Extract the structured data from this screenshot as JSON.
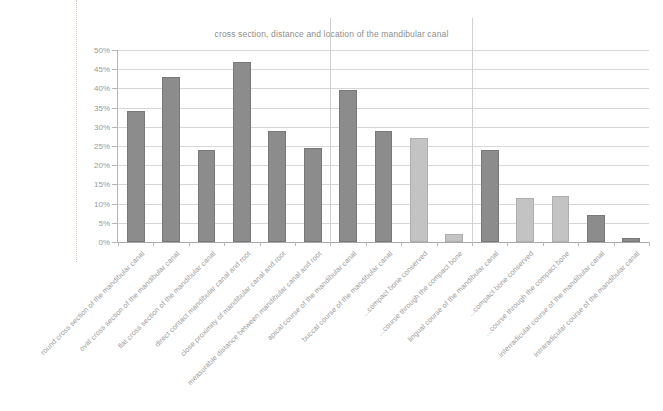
{
  "chart_data": {
    "type": "bar",
    "title": "cross section, distance and location of the mandibular canal",
    "xlabel": "",
    "ylabel": "",
    "ylim": [
      0,
      50
    ],
    "ytick_labels": [
      "0%",
      "5%",
      "10%",
      "15%",
      "20%",
      "25%",
      "30%",
      "35%",
      "40%",
      "45%",
      "50%"
    ],
    "ytick_values": [
      0,
      5,
      10,
      15,
      20,
      25,
      30,
      35,
      40,
      45,
      50
    ],
    "grid": true,
    "legend": "none",
    "value_unit": "percent",
    "categories": [
      "round cross section of the mandibular canal",
      "oval cross section of the mandibular canal",
      "flat cross section of the mandibular canal",
      "direct contact mandibular canal and root",
      "close proximity of mandibular canal and root",
      "measurable distance between mandibular canal and root",
      "apical course of the mandibular canal",
      "buccal course of the mandibular canal",
      "...compact bone conserved",
      "...course through the compact bone",
      "lingual course of the mandibular canal",
      "...compact bone conserved",
      "...course through the compact bone",
      "interradicular course of the mandibular canal",
      "intraradicular course of the mandibular canal"
    ],
    "values": [
      34,
      43,
      24,
      47,
      29,
      24.5,
      39.5,
      29,
      27,
      2,
      24,
      11.5,
      12,
      7,
      1
    ],
    "bar_shades": [
      "dark",
      "dark",
      "dark",
      "dark",
      "dark",
      "dark",
      "dark",
      "dark",
      "light",
      "light",
      "dark",
      "light",
      "light",
      "dark",
      "dark"
    ],
    "group_separators_after": [
      5,
      9
    ],
    "colors": {
      "bar_dark": "#8c8c8c",
      "bar_light": "#c3c3c3",
      "gridline": "#d7d7d7",
      "axis": "#b5b5b5",
      "text": "#9a9a9a"
    }
  }
}
